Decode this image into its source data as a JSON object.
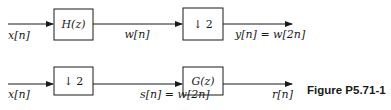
{
  "colors": {
    "stroke": "#1a1a1a",
    "background": "#ffffff"
  },
  "figure_label": "Figure P5.71-1",
  "system1": {
    "input_label": "x[n]",
    "block1_label": "H(z)",
    "mid_label": "w[n]",
    "block2_label": "↓ 2",
    "output_label": "y[n] = w[2n]"
  },
  "system2": {
    "input_label": "x[n]",
    "block1_label": "↓ 2",
    "mid_label": "s[n] = w[2n]",
    "block2_label": "G(z)",
    "output_label": "r[n]"
  }
}
